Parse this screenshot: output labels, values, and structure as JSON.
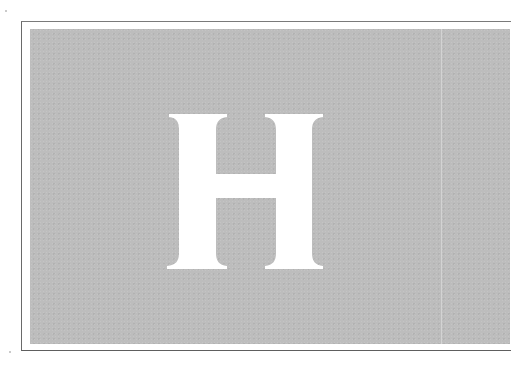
{
  "page": {
    "drop_cap": {
      "letter": "H",
      "color": "#ffffff"
    },
    "panel": {
      "background_color": "#bdbdbd",
      "border_color": "#6a6a6a"
    },
    "page_background": "#ffffff"
  }
}
